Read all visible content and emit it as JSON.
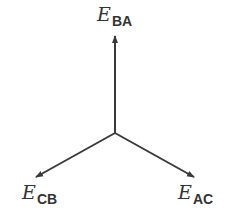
{
  "diagram": {
    "center": {
      "x": 115,
      "y": 133
    },
    "stroke_color": "#3a3a3a",
    "phasors": [
      {
        "id": "BA",
        "symbol": "E",
        "subscript": "BA",
        "tip": {
          "x": 115,
          "y": 35
        },
        "label_pos": {
          "x": 97,
          "y": 6
        }
      },
      {
        "id": "CB",
        "symbol": "E",
        "subscript": "CB",
        "tip": {
          "x": 35,
          "y": 178
        },
        "label_pos": {
          "x": 22,
          "y": 186
        }
      },
      {
        "id": "AC",
        "symbol": "E",
        "subscript": "AC",
        "tip": {
          "x": 195,
          "y": 178
        },
        "label_pos": {
          "x": 178,
          "y": 186
        }
      }
    ]
  }
}
